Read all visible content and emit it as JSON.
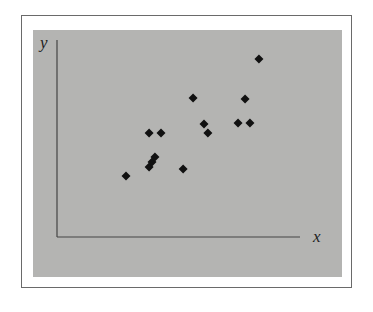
{
  "chart_data": {
    "type": "scatter",
    "title": "",
    "xlabel": "x",
    "ylabel": "y",
    "xlim": [
      0,
      10
    ],
    "ylim": [
      0,
      10
    ],
    "grid": false,
    "legend": null,
    "marker": "diamond",
    "colors": {
      "panel": "#b4b4b2",
      "marker": "#111111",
      "axis": "#444444",
      "frame": "#6a6a6a"
    },
    "points": [
      {
        "x": 2.84,
        "y": 3.1
      },
      {
        "x": 3.79,
        "y": 3.55
      },
      {
        "x": 3.91,
        "y": 3.81
      },
      {
        "x": 4.03,
        "y": 4.06
      },
      {
        "x": 3.79,
        "y": 5.28
      },
      {
        "x": 4.28,
        "y": 5.28
      },
      {
        "x": 5.19,
        "y": 3.45
      },
      {
        "x": 5.6,
        "y": 7.06
      },
      {
        "x": 6.05,
        "y": 5.74
      },
      {
        "x": 6.21,
        "y": 5.28
      },
      {
        "x": 7.45,
        "y": 5.79
      },
      {
        "x": 7.94,
        "y": 5.79
      },
      {
        "x": 7.74,
        "y": 7.01
      },
      {
        "x": 8.31,
        "y": 9.04
      }
    ]
  }
}
